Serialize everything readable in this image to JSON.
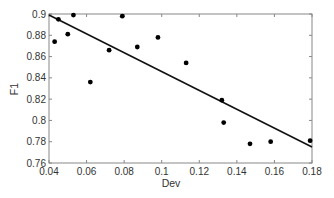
{
  "chart_data": {
    "type": "scatter",
    "title": "",
    "xlabel": "Dev",
    "ylabel": "F1",
    "xlim": [
      0.04,
      0.18
    ],
    "ylim": [
      0.76,
      0.9
    ],
    "grid": false,
    "legend": null,
    "x_ticks": [
      0.04,
      0.06,
      0.08,
      0.1,
      0.12,
      0.14,
      0.16,
      0.18
    ],
    "x_tick_labels": [
      "0.04",
      "0.06",
      "0.08",
      "0.1",
      "0.12",
      "0.14",
      "0.16",
      "0.18"
    ],
    "y_ticks": [
      0.76,
      0.78,
      0.8,
      0.82,
      0.84,
      0.86,
      0.88,
      0.9
    ],
    "y_tick_labels": [
      "0.76",
      "0.78",
      "0.8",
      "0.82",
      "0.84",
      "0.86",
      "0.88",
      "0.9"
    ],
    "series": [
      {
        "name": "points",
        "type": "scatter",
        "x": [
          0.043,
          0.045,
          0.05,
          0.053,
          0.062,
          0.072,
          0.079,
          0.087,
          0.098,
          0.113,
          0.132,
          0.133,
          0.147,
          0.158,
          0.179
        ],
        "y": [
          0.874,
          0.895,
          0.881,
          0.899,
          0.836,
          0.866,
          0.898,
          0.869,
          0.878,
          0.854,
          0.819,
          0.798,
          0.778,
          0.78,
          0.781
        ]
      },
      {
        "name": "linear fit",
        "type": "line",
        "x": [
          0.04,
          0.18
        ],
        "y": [
          0.899,
          0.775
        ]
      }
    ]
  },
  "colors": {
    "marker": "#000000",
    "fit_line": "#111111",
    "axes": "#888888",
    "text": "#333333"
  }
}
